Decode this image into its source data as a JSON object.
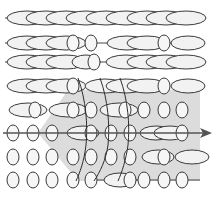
{
  "diagram": {
    "colors": {
      "background": "#ffffff",
      "region_fill": "#dcdcdc",
      "glyph_fill": "#f2f2f2",
      "glyph_stroke": "#3a3a3a",
      "arrow": "#555555"
    },
    "shaded_region": {
      "points": [
        [
          68,
          90
        ],
        [
          200,
          90
        ],
        [
          200,
          181
        ],
        [
          78,
          181
        ],
        [
          38,
          133
        ]
      ]
    },
    "arrow": {
      "y": 133,
      "x_start": 3,
      "x_end": 212,
      "head": "arrow-right-icon"
    },
    "rows": [
      {
        "y": 18,
        "line": [
          5,
          190
        ],
        "glyphs": [
          {
            "cx": 27,
            "rx": 20,
            "ry": 7
          },
          {
            "cx": 46,
            "rx": 20,
            "ry": 7
          },
          {
            "cx": 66,
            "rx": 20,
            "ry": 7
          },
          {
            "cx": 86,
            "rx": 20,
            "ry": 7
          },
          {
            "cx": 106,
            "rx": 20,
            "ry": 7
          },
          {
            "cx": 126,
            "rx": 20,
            "ry": 7
          },
          {
            "cx": 147,
            "rx": 20,
            "ry": 7
          },
          {
            "cx": 166,
            "rx": 20,
            "ry": 7
          },
          {
            "cx": 186,
            "rx": 20,
            "ry": 7
          }
        ]
      },
      {
        "y": 43,
        "line": [
          5,
          190
        ],
        "glyphs": [
          {
            "cx": 27,
            "rx": 20,
            "ry": 7
          },
          {
            "cx": 46,
            "rx": 20,
            "ry": 7
          },
          {
            "cx": 66,
            "rx": 20,
            "ry": 7
          },
          {
            "cx": 73,
            "rx": 6,
            "ry": 8
          },
          {
            "cx": 91,
            "rx": 6,
            "ry": 8
          },
          {
            "cx": 127,
            "rx": 20,
            "ry": 7
          },
          {
            "cx": 147,
            "rx": 20,
            "ry": 7
          },
          {
            "cx": 164,
            "rx": 6,
            "ry": 8
          },
          {
            "cx": 188,
            "rx": 17,
            "ry": 7
          }
        ]
      },
      {
        "y": 62,
        "line": [
          5,
          190
        ],
        "glyphs": [
          {
            "cx": 27,
            "rx": 20,
            "ry": 7
          },
          {
            "cx": 46,
            "rx": 20,
            "ry": 7
          },
          {
            "cx": 66,
            "rx": 20,
            "ry": 7
          },
          {
            "cx": 86,
            "rx": 14,
            "ry": 7
          },
          {
            "cx": 94,
            "rx": 6,
            "ry": 8
          },
          {
            "cx": 126,
            "rx": 20,
            "ry": 7
          },
          {
            "cx": 147,
            "rx": 20,
            "ry": 7
          },
          {
            "cx": 166,
            "rx": 20,
            "ry": 7
          },
          {
            "cx": 186,
            "rx": 20,
            "ry": 7
          }
        ]
      },
      {
        "y": 86,
        "line": null,
        "glyphs": [
          {
            "cx": 27,
            "rx": 20,
            "ry": 7
          },
          {
            "cx": 46,
            "rx": 20,
            "ry": 7
          },
          {
            "cx": 66,
            "rx": 20,
            "ry": 7
          },
          {
            "cx": 73,
            "rx": 6,
            "ry": 8
          },
          {
            "cx": 105,
            "rx": 20,
            "ry": 7
          },
          {
            "cx": 126,
            "rx": 20,
            "ry": 7
          },
          {
            "cx": 147,
            "rx": 20,
            "ry": 7
          },
          {
            "cx": 164,
            "rx": 6,
            "ry": 8
          },
          {
            "cx": 188,
            "rx": 17,
            "ry": 7
          }
        ]
      },
      {
        "y": 110,
        "line": null,
        "glyphs": [
          {
            "cx": 28,
            "rx": 19,
            "ry": 7
          },
          {
            "cx": 35,
            "rx": 6,
            "ry": 8
          },
          {
            "cx": 68,
            "rx": 19,
            "ry": 7
          },
          {
            "cx": 73,
            "rx": 6,
            "ry": 8
          },
          {
            "cx": 91,
            "rx": 6,
            "ry": 8
          },
          {
            "cx": 119,
            "rx": 19,
            "ry": 7
          },
          {
            "cx": 125,
            "rx": 6,
            "ry": 8
          },
          {
            "cx": 144,
            "rx": 6,
            "ry": 8
          },
          {
            "cx": 164,
            "rx": 6,
            "ry": 8
          },
          {
            "cx": 182,
            "rx": 6,
            "ry": 8
          }
        ]
      },
      {
        "y": 133,
        "line": null,
        "glyphs": [
          {
            "cx": 13,
            "rx": 6,
            "ry": 8
          },
          {
            "cx": 33,
            "rx": 6,
            "ry": 8
          },
          {
            "cx": 52,
            "rx": 6,
            "ry": 8
          },
          {
            "cx": 83,
            "rx": 16,
            "ry": 7
          },
          {
            "cx": 91,
            "rx": 6,
            "ry": 8
          },
          {
            "cx": 111,
            "rx": 6,
            "ry": 8
          },
          {
            "cx": 130,
            "rx": 6,
            "ry": 8
          },
          {
            "cx": 156,
            "rx": 16,
            "ry": 7
          },
          {
            "cx": 170,
            "rx": 16,
            "ry": 7
          },
          {
            "cx": 182,
            "rx": 6,
            "ry": 8
          }
        ]
      },
      {
        "y": 157,
        "line": null,
        "glyphs": [
          {
            "cx": 13,
            "rx": 6,
            "ry": 8
          },
          {
            "cx": 33,
            "rx": 6,
            "ry": 8
          },
          {
            "cx": 52,
            "rx": 6,
            "ry": 8
          },
          {
            "cx": 73,
            "rx": 6,
            "ry": 8
          },
          {
            "cx": 91,
            "rx": 6,
            "ry": 8
          },
          {
            "cx": 111,
            "rx": 6,
            "ry": 8
          },
          {
            "cx": 130,
            "rx": 6,
            "ry": 8
          },
          {
            "cx": 158,
            "rx": 16,
            "ry": 7
          },
          {
            "cx": 164,
            "rx": 6,
            "ry": 8
          },
          {
            "cx": 192,
            "rx": 17,
            "ry": 7
          }
        ]
      },
      {
        "y": 180,
        "line": [
          91,
          200
        ],
        "glyphs": [
          {
            "cx": 13,
            "rx": 6,
            "ry": 8
          },
          {
            "cx": 33,
            "rx": 6,
            "ry": 8
          },
          {
            "cx": 52,
            "rx": 6,
            "ry": 8
          },
          {
            "cx": 73,
            "rx": 6,
            "ry": 8
          },
          {
            "cx": 91,
            "rx": 6,
            "ry": 8
          },
          {
            "cx": 120,
            "rx": 16,
            "ry": 7
          },
          {
            "cx": 130,
            "rx": 6,
            "ry": 8
          },
          {
            "cx": 144,
            "rx": 6,
            "ry": 8
          },
          {
            "cx": 164,
            "rx": 6,
            "ry": 8
          },
          {
            "cx": 182,
            "rx": 6,
            "ry": 8
          }
        ]
      }
    ],
    "curves": [
      "M78,78 C86,100 88,125 86,145 C84,162 80,172 76,181",
      "M100,78 C108,100 110,125 108,145 C106,160 100,172 94,181",
      "M120,78 C128,100 130,125 128,145 C126,160 122,172 118,181"
    ]
  }
}
